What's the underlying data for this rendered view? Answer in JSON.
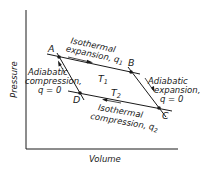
{
  "diagram": {
    "axes": {
      "x_label": "Volume",
      "y_label": "Pressure"
    },
    "points": {
      "A": "A",
      "B": "B",
      "C": "C",
      "D": "D"
    },
    "temperatures": {
      "T1": "T",
      "T1_sub": "1",
      "T2": "T",
      "T2_sub": "2"
    },
    "processes": {
      "isothermal_expansion": {
        "line1": "Isothermal",
        "line2": "expansion, q",
        "sub": "1"
      },
      "adiabatic_expansion": {
        "line1": "Adiabatic",
        "line2": "expansion,",
        "line3": "q = 0"
      },
      "isothermal_compression": {
        "line1": "Isothermal",
        "line2": "compression, q",
        "sub": "2"
      },
      "adiabatic_compression": {
        "line1": "Adiabatic",
        "line2": "compression,",
        "line3": "q = 0"
      }
    },
    "colors": {
      "ink": "#1a1a1a",
      "background": "#ffffff"
    }
  }
}
